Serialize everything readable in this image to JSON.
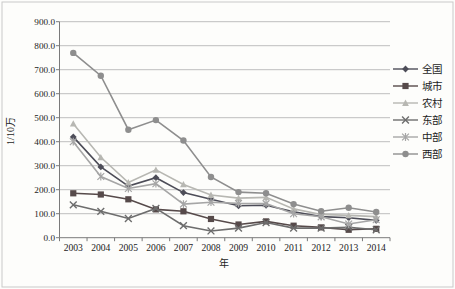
{
  "figure": {
    "background": "#fdfdfb",
    "border_color": "#c9c9c9",
    "grid_color": "#aeaeae",
    "axis_color": "#7a7a7a"
  },
  "chart_data": {
    "type": "line",
    "title": "",
    "xlabel": "年",
    "ylabel": "1/10万",
    "x": [
      "2003",
      "2004",
      "2005",
      "2006",
      "2007",
      "2008",
      "2009",
      "2010",
      "2011",
      "2012",
      "2013",
      "2014"
    ],
    "ylim": [
      0,
      900
    ],
    "ytick_step": 100,
    "ytick_labels": [
      "0.0",
      "100.0",
      "200.0",
      "300.0",
      "400.0",
      "500.0",
      "600.0",
      "700.0",
      "800.0",
      "900.0"
    ],
    "grid": true,
    "legend_position": "right",
    "series": [
      {
        "name": "全国",
        "marker": "diamond",
        "color": "#4d4d58",
        "values": [
          420,
          295,
          215,
          250,
          188,
          160,
          133,
          135,
          108,
          88,
          83,
          72
        ]
      },
      {
        "name": "城市",
        "marker": "square",
        "color": "#564a4a",
        "values": [
          185,
          180,
          160,
          118,
          110,
          78,
          55,
          68,
          50,
          43,
          33,
          37
        ]
      },
      {
        "name": "农村",
        "marker": "triangle",
        "color": "#b7b7b2",
        "values": [
          475,
          335,
          230,
          283,
          222,
          178,
          165,
          168,
          120,
          97,
          93,
          88
        ]
      },
      {
        "name": "东部",
        "marker": "x",
        "color": "#6d6d6d",
        "values": [
          137,
          110,
          80,
          122,
          50,
          28,
          40,
          63,
          40,
          40,
          43,
          33
        ]
      },
      {
        "name": "中部",
        "marker": "star",
        "color": "#a6a6a6",
        "values": [
          400,
          255,
          205,
          225,
          140,
          148,
          143,
          142,
          100,
          87,
          57,
          75
        ]
      },
      {
        "name": "西部",
        "marker": "circle",
        "color": "#8e8e8e",
        "values": [
          770,
          675,
          450,
          490,
          405,
          253,
          190,
          185,
          140,
          110,
          125,
          107
        ]
      }
    ]
  }
}
